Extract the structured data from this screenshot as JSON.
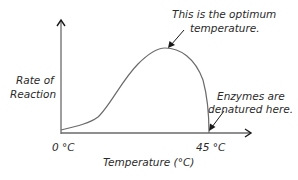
{
  "diagram": {
    "title": "",
    "y_axis_label_line1": "Rate of",
    "y_axis_label_line2": "Reaction",
    "x_axis_label": "Temperature (°C)",
    "x_tick_start": "0 °C",
    "x_tick_end": "45 °C",
    "annotation_optimum_line1": "This is the optimum",
    "annotation_optimum_line2": "temperature.",
    "annotation_denatured_line1": "Enzymes are",
    "annotation_denatured_line2": "denatured here.",
    "colors": {
      "axis": "#6a6a6a",
      "curve": "#6a6a6a",
      "arrow": "#1a1a1a",
      "text": "#2a2a2a"
    }
  }
}
